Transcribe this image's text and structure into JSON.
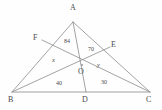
{
  "figure": {
    "type": "geometry-diagram",
    "stroke_color": "#8c8c8c",
    "text_color": "#4a4a4a",
    "background": "#fefefe"
  },
  "vertices": [
    {
      "name": "A",
      "label": "A",
      "x": 73,
      "y": 22,
      "label_x": 70,
      "label_y": 4
    },
    {
      "name": "B",
      "label": "B",
      "x": 12,
      "y": 92,
      "label_x": 8,
      "label_y": 96
    },
    {
      "name": "C",
      "label": "C",
      "x": 150,
      "y": 92,
      "label_x": 146,
      "label_y": 96
    },
    {
      "name": "D",
      "label": "D",
      "x": 86,
      "y": 92,
      "label_x": 82,
      "label_y": 96
    },
    {
      "name": "E",
      "label": "E",
      "x": 110,
      "y": 47,
      "label_x": 111,
      "label_y": 41
    },
    {
      "name": "F",
      "label": "F",
      "x": 42,
      "y": 40,
      "label_x": 33,
      "label_y": 34
    },
    {
      "name": "O",
      "label": "O",
      "x": 82,
      "y": 65,
      "label_x": 78,
      "label_y": 68
    }
  ],
  "segments": [
    {
      "name": "side-AB",
      "from": "A",
      "to": "B"
    },
    {
      "name": "side-AC",
      "from": "A",
      "to": "C"
    },
    {
      "name": "side-BC",
      "from": "B",
      "to": "C"
    },
    {
      "name": "cevian-BE",
      "from": "B",
      "to": "E"
    },
    {
      "name": "cevian-CF",
      "from": "C",
      "to": "F"
    },
    {
      "name": "cevian-AD",
      "from": "A",
      "to": "D"
    }
  ],
  "angle_labels": [
    {
      "name": "angle-84",
      "text": "84",
      "x": 64,
      "y": 38
    },
    {
      "name": "angle-70",
      "text": "70",
      "x": 88,
      "y": 46
    },
    {
      "name": "angle-x",
      "text": "x",
      "x": 52,
      "y": 57
    },
    {
      "name": "angle-y",
      "text": "y",
      "x": 97,
      "y": 62
    },
    {
      "name": "angle-40",
      "text": "40",
      "x": 56,
      "y": 80
    },
    {
      "name": "angle-30",
      "text": "30",
      "x": 101,
      "y": 79
    }
  ]
}
